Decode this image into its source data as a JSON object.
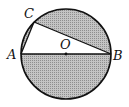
{
  "diagram": {
    "type": "geometry-circle",
    "colors": {
      "stroke": "#111111",
      "shade": "#b8b8b8",
      "background": "#ffffff"
    },
    "circle": {
      "center": "O",
      "cx": 66,
      "cy": 54,
      "r": 45
    },
    "points": {
      "A": {
        "label": "A",
        "x": 21,
        "y": 54
      },
      "B": {
        "label": "B",
        "x": 111,
        "y": 54
      },
      "C": {
        "label": "C",
        "x": 34,
        "y": 22
      },
      "O": {
        "label": "O",
        "x": 66,
        "y": 54
      }
    },
    "segments": [
      "AB",
      "AC",
      "BC"
    ],
    "shaded_regions": [
      "circle minus triangle ABC"
    ]
  }
}
